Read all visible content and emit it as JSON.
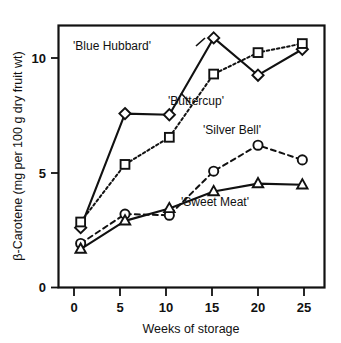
{
  "chart_data": {
    "type": "line",
    "title": "",
    "xlabel": "Weeks of storage",
    "ylabel": "β-Carotene (mg per 100 g dry fruit wt)",
    "x": [
      0,
      5,
      10,
      15,
      20,
      25
    ],
    "xticklabels": [
      "0",
      "5",
      "10",
      "15",
      "20",
      "25"
    ],
    "yticklabels": [
      "0",
      "5",
      "10"
    ],
    "yticks": [
      0,
      5,
      10
    ],
    "xlim": [
      -2.5,
      27.5
    ],
    "ylim": [
      0,
      11.6
    ],
    "grid": false,
    "legend_position": "inline-annotations",
    "series": [
      {
        "name": "'Blue Hubbard'",
        "marker": "diamond",
        "linestyle": "solid",
        "values": [
          2.65,
          7.7,
          7.65,
          11.05,
          9.4,
          10.55
        ]
      },
      {
        "name": "'Buttercup'",
        "marker": "square",
        "linestyle": "dotted",
        "values": [
          2.9,
          5.45,
          6.65,
          9.45,
          10.4,
          10.8
        ]
      },
      {
        "name": "'Silver Bell'",
        "marker": "circle",
        "linestyle": "dashed",
        "values": [
          1.95,
          3.25,
          3.2,
          5.15,
          6.3,
          5.65
        ]
      },
      {
        "name": "'Sweet Meat'",
        "marker": "triangle",
        "linestyle": "solid",
        "values": [
          1.7,
          2.95,
          3.5,
          4.25,
          4.6,
          4.55
        ]
      }
    ],
    "annotations": [
      {
        "text": "'Blue Hubbard'",
        "x_px": 112,
        "y_px": 50
      },
      {
        "text": "'Buttercup'",
        "x_px": 196,
        "y_px": 105
      },
      {
        "text": "'Silver Bell'",
        "x_px": 232,
        "y_px": 134
      },
      {
        "text": "'Sweet Meat'",
        "x_px": 215,
        "y_px": 206
      }
    ]
  },
  "axes": {
    "x_title": "Weeks of storage",
    "y_title": "β-Carotene (mg per 100 g dry fruit wt)",
    "x_tick_labels": [
      "0",
      "5",
      "10",
      "15",
      "20",
      "25"
    ],
    "y_tick_labels": [
      "10",
      "5",
      "0"
    ]
  },
  "colors": {
    "ink": "#111111",
    "background": "#ffffff",
    "marker_fill": "#ffffff"
  }
}
